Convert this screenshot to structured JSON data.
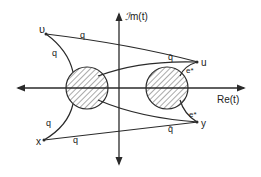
{
  "diagram": {
    "type": "complex-plane contour diagram",
    "axes": {
      "horizontal_label": "Re(t)",
      "vertical_label": "Im(t)",
      "vertical_label_prefix": "ℐ",
      "vertical_label_suffix": "m(t)"
    },
    "regions": [
      {
        "name": "left-hatched-disk",
        "shaded": true
      },
      {
        "name": "right-hatched-disk",
        "shaded": true
      }
    ],
    "points": {
      "v": "υ",
      "u": "u",
      "x": "x",
      "y": "y"
    },
    "edge_labels": {
      "v_to_u": "q",
      "v_to_left_disk": "q",
      "right_disk_to_u": "q̄",
      "u_to_right_disk": "e*",
      "x_to_left_disk": "q",
      "x_to_right": "q",
      "left_disk_to_y": "q̄",
      "y_to_right_disk": "e*"
    },
    "colors": {
      "ink": "#2a2a2a",
      "background": "#ffffff"
    }
  }
}
